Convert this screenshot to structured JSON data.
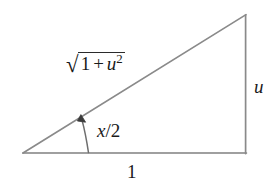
{
  "figure": {
    "kind": "geometry-diagram",
    "caption": "",
    "width": 277,
    "height": 188,
    "background_color": "#ffffff",
    "stroke_color": "#808080",
    "text_color": "#1a1a1a"
  },
  "labels": {
    "hypotenuse": {
      "name": "sqrt-1-plus-u-squared",
      "radical_sign": "√",
      "radicand_first": "1",
      "operator": "+",
      "radicand_second": "u",
      "exponent": "2",
      "plain_text": "√(1 + u²)"
    },
    "vertical_leg": {
      "name": "u-label",
      "text": "u"
    },
    "base": {
      "name": "one-label",
      "text": "1"
    },
    "angle": {
      "name": "x-over-2-label",
      "text": "x/2"
    }
  },
  "chart_data": {
    "type": "diagram",
    "title": "",
    "shape": "right triangle",
    "vertices": {
      "left": [
        23,
        153
      ],
      "bottom_right": [
        246,
        153
      ],
      "top_right": [
        246,
        15
      ]
    },
    "sides": [
      {
        "name": "base",
        "from": "left",
        "to": "bottom_right",
        "label": "1",
        "length_units": 1
      },
      {
        "name": "vertical-leg",
        "from": "bottom_right",
        "to": "top_right",
        "label": "u",
        "length_units": "u"
      },
      {
        "name": "hypotenuse",
        "from": "left",
        "to": "top_right",
        "label": "√(1 + u²)",
        "length_units": "sqrt(1+u^2)"
      }
    ],
    "angles": [
      {
        "at": "left",
        "label": "x/2",
        "marker": "arc-with-arrowhead"
      },
      {
        "at": "bottom_right",
        "label": "",
        "marker": "right-angle"
      }
    ],
    "relation": "tan(x/2) = u"
  }
}
